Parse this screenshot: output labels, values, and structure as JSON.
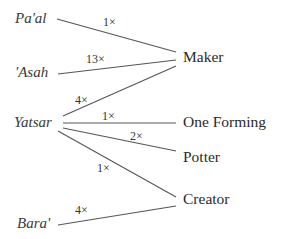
{
  "diagram": {
    "sources": [
      {
        "id": "paal",
        "label": "Pa'al"
      },
      {
        "id": "asah",
        "label": "'Asah"
      },
      {
        "id": "yatsar",
        "label": "Yatsar"
      },
      {
        "id": "bara",
        "label": "Bara'"
      }
    ],
    "targets": [
      {
        "id": "maker",
        "label": "Maker"
      },
      {
        "id": "one_forming",
        "label": "One Forming"
      },
      {
        "id": "potter",
        "label": "Potter"
      },
      {
        "id": "creator",
        "label": "Creator"
      }
    ],
    "edges": [
      {
        "from": "Pa'al",
        "to": "Maker",
        "count": "1×"
      },
      {
        "from": "'Asah",
        "to": "Maker",
        "count": "13×"
      },
      {
        "from": "Yatsar",
        "to": "Maker",
        "count": "4×"
      },
      {
        "from": "Yatsar",
        "to": "One Forming",
        "count": "1×"
      },
      {
        "from": "Yatsar",
        "to": "Potter",
        "count": "2×"
      },
      {
        "from": "Yatsar",
        "to": "Creator",
        "count": "1×"
      },
      {
        "from": "Bara'",
        "to": "Creator",
        "count": "4×"
      }
    ],
    "line_color": "#555555"
  }
}
